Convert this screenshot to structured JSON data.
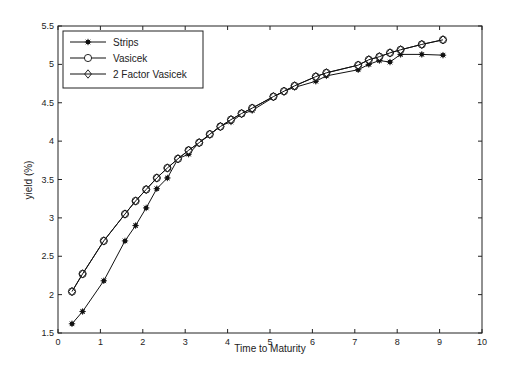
{
  "chart_data": {
    "type": "line",
    "title": "",
    "xlabel": "Time to Maturity",
    "ylabel": "yield (%)",
    "xlim": [
      0,
      10
    ],
    "ylim": [
      1.5,
      5.5
    ],
    "xticks": [
      0,
      1,
      2,
      3,
      4,
      5,
      6,
      7,
      8,
      9,
      10
    ],
    "yticks": [
      1.5,
      2,
      2.5,
      3,
      3.5,
      4,
      4.5,
      5,
      5.5
    ],
    "grid": false,
    "legend_position": "upper left",
    "x": [
      0.33,
      0.58,
      1.08,
      1.58,
      1.83,
      2.08,
      2.33,
      2.58,
      2.83,
      3.08,
      3.33,
      3.58,
      3.83,
      4.08,
      4.33,
      4.58,
      5.08,
      5.33,
      5.58,
      6.08,
      6.33,
      7.08,
      7.33,
      7.58,
      7.83,
      8.08,
      8.58,
      9.08
    ],
    "series": [
      {
        "name": "Strips",
        "marker": "star",
        "values": [
          1.62,
          1.78,
          2.18,
          2.7,
          2.9,
          3.13,
          3.38,
          3.52,
          3.77,
          3.83,
          3.98,
          4.08,
          4.2,
          4.25,
          4.35,
          4.4,
          4.57,
          4.65,
          4.7,
          4.78,
          4.85,
          4.93,
          5.0,
          5.05,
          5.03,
          5.13,
          5.13,
          5.12
        ]
      },
      {
        "name": "Vasicek",
        "marker": "circle",
        "values": [
          2.04,
          2.27,
          2.7,
          3.05,
          3.22,
          3.37,
          3.52,
          3.65,
          3.77,
          3.88,
          3.98,
          4.09,
          4.19,
          4.28,
          4.36,
          4.43,
          4.58,
          4.65,
          4.72,
          4.84,
          4.89,
          4.99,
          5.06,
          5.1,
          5.15,
          5.19,
          5.26,
          5.32
        ]
      },
      {
        "name": "2 Factor Vasicek",
        "marker": "diamond",
        "values": [
          2.04,
          2.27,
          2.7,
          3.05,
          3.22,
          3.37,
          3.52,
          3.65,
          3.77,
          3.88,
          3.98,
          4.09,
          4.19,
          4.28,
          4.36,
          4.43,
          4.58,
          4.65,
          4.72,
          4.84,
          4.89,
          4.99,
          5.06,
          5.1,
          5.15,
          5.19,
          5.26,
          5.32
        ]
      }
    ]
  }
}
